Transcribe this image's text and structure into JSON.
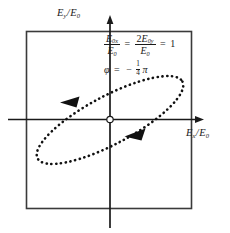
{
  "figure": {
    "name": "polarization-ellipse-diagram",
    "background_color": "#ffffff",
    "ink_color": "#1a1a1a"
  },
  "axes": {
    "y_label": {
      "numerator": "E",
      "numerator_sub": "y",
      "denominator": "E",
      "denominator_sub": "0",
      "text": "Ey/E0"
    },
    "x_label": {
      "numerator": "E",
      "numerator_sub": "x",
      "denominator": "E",
      "denominator_sub": "0",
      "text": "Ex/E0"
    },
    "origin_marker": "small-circle",
    "x_arrow": "right",
    "y_arrow": "up"
  },
  "annotations": {
    "amplitude_equation": {
      "term1_num": "E",
      "term1_num_sub": "0x",
      "term1_den": "E",
      "term1_den_sub": "0",
      "equals1": "=",
      "term2_coef": "2",
      "term2_num": "E",
      "term2_num_sub": "0y",
      "term2_den": "E",
      "term2_den_sub": "0",
      "equals2": "=",
      "value": "1",
      "text": "E0x/E0 = 2E0y/E0 = 1"
    },
    "phase_equation": {
      "symbol": "φ",
      "equals": "=",
      "sign": "−",
      "fraction_num": "1",
      "fraction_den": "4",
      "pi": "π",
      "text": "φ = −(1/4)π"
    }
  },
  "curve": {
    "name": "polarization-ellipse",
    "style": "dotted",
    "tilt_degrees": -28,
    "semi_major_px": 82,
    "semi_minor_px": 24,
    "center_x_px": 110,
    "center_y_px": 120,
    "direction_arrows": 2,
    "rotation_sense": "clockwise"
  },
  "frame": {
    "left_px": 26,
    "top_px": 31,
    "right_px": 192,
    "bottom_px": 209
  }
}
